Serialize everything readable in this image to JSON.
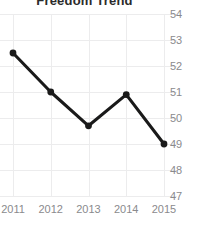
{
  "chart_data": {
    "type": "line",
    "title": "Freedom Trend",
    "xlabel": "",
    "ylabel": "",
    "categories": [
      "2011",
      "2012",
      "2013",
      "2014",
      "2015"
    ],
    "values": [
      52.5,
      51.0,
      49.7,
      50.9,
      49.0
    ],
    "series": [
      {
        "name": "Freedom Score",
        "values": [
          52.5,
          51.0,
          49.7,
          50.9,
          49.0
        ]
      }
    ],
    "ylim": [
      47,
      54
    ],
    "yticks": [
      "54",
      "53",
      "52",
      "51",
      "50",
      "49",
      "48",
      "47"
    ],
    "ytick_values": [
      54,
      53,
      52,
      51,
      50,
      49,
      48,
      47
    ],
    "xticks": [
      "2011",
      "2012",
      "2013",
      "2014",
      "2015"
    ],
    "grid": true,
    "legend": false,
    "legend_position": "none",
    "y_axis_position": "right",
    "marker": "circle",
    "colors": {
      "line": "#1a1a1a",
      "marker": "#1a1a1a",
      "grid": "#ececed",
      "tick_label": "#8a8a8d",
      "title": "#2b2b2b",
      "background": "#ffffff"
    }
  }
}
